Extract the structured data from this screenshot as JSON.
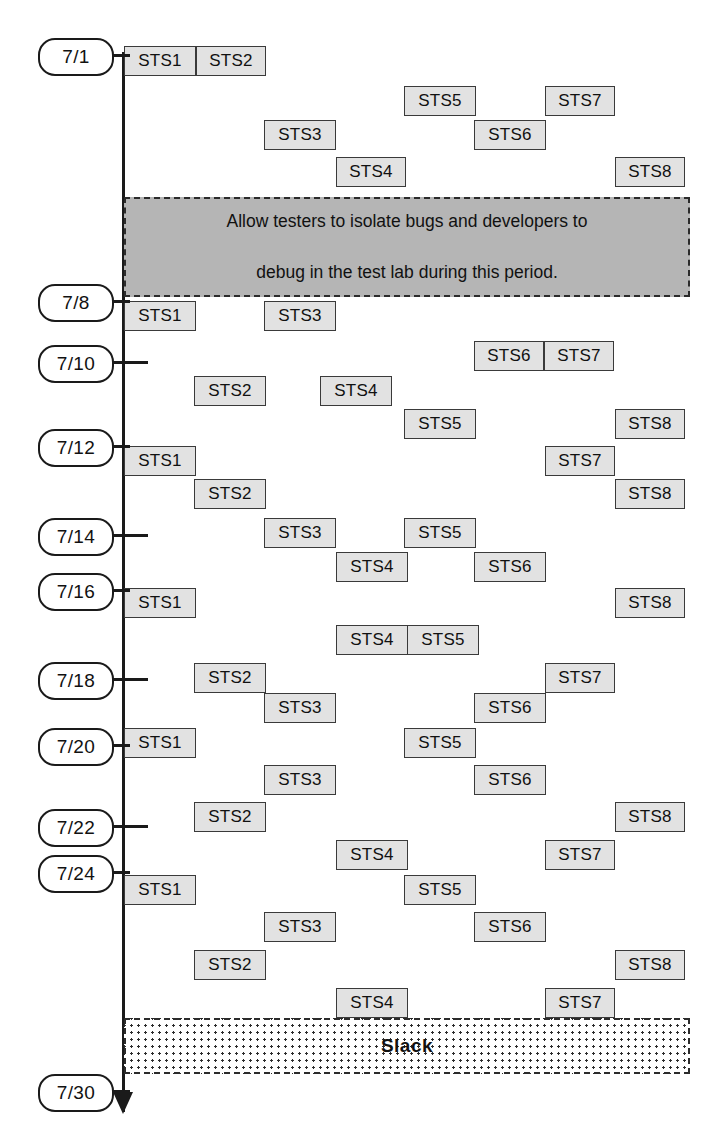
{
  "diagram": {
    "axis": {
      "orientation": "vertical-downward",
      "color": "#1a1a1a"
    },
    "box_fill": "#e2e2e2",
    "note_fill": "#b5b5b5",
    "dates": [
      {
        "label": "7/1",
        "y": 38
      },
      {
        "label": "7/8",
        "y": 284
      },
      {
        "label": "7/10",
        "y": 345
      },
      {
        "label": "7/12",
        "y": 429
      },
      {
        "label": "7/14",
        "y": 518
      },
      {
        "label": "7/16",
        "y": 573
      },
      {
        "label": "7/18",
        "y": 662
      },
      {
        "label": "7/20",
        "y": 728
      },
      {
        "label": "7/22",
        "y": 809
      },
      {
        "label": "7/24",
        "y": 855
      },
      {
        "label": "7/30",
        "y": 1074
      }
    ],
    "ticks": [
      {
        "for": "7/1",
        "long": true
      },
      {
        "for": "7/8",
        "long": true
      },
      {
        "for": "7/10",
        "long": false
      },
      {
        "for": "7/12",
        "long": true
      },
      {
        "for": "7/14",
        "long": false
      },
      {
        "for": "7/16",
        "long": true
      },
      {
        "for": "7/18",
        "long": false
      },
      {
        "for": "7/20",
        "long": true
      },
      {
        "for": "7/22",
        "long": false
      },
      {
        "for": "7/24",
        "long": true
      },
      {
        "for": "7/30",
        "long": true
      }
    ],
    "tasks": [
      {
        "label": "STS1",
        "x": 124,
        "y": 46,
        "w": 72
      },
      {
        "label": "STS2",
        "x": 196,
        "y": 46,
        "w": 70
      },
      {
        "label": "STS5",
        "x": 404,
        "y": 86,
        "w": 72
      },
      {
        "label": "STS7",
        "x": 545,
        "y": 86,
        "w": 70
      },
      {
        "label": "STS3",
        "x": 264,
        "y": 120,
        "w": 72
      },
      {
        "label": "STS6",
        "x": 474,
        "y": 120,
        "w": 72
      },
      {
        "label": "STS4",
        "x": 336,
        "y": 157,
        "w": 70
      },
      {
        "label": "STS8",
        "x": 615,
        "y": 157,
        "w": 70
      },
      {
        "label": "STS1",
        "x": 124,
        "y": 301,
        "w": 72
      },
      {
        "label": "STS3",
        "x": 264,
        "y": 301,
        "w": 72
      },
      {
        "label": "STS6",
        "x": 474,
        "y": 341,
        "w": 70
      },
      {
        "label": "STS7",
        "x": 544,
        "y": 341,
        "w": 70
      },
      {
        "label": "STS2",
        "x": 194,
        "y": 376,
        "w": 72
      },
      {
        "label": "STS4",
        "x": 320,
        "y": 376,
        "w": 72
      },
      {
        "label": "STS5",
        "x": 404,
        "y": 409,
        "w": 72
      },
      {
        "label": "STS8",
        "x": 615,
        "y": 409,
        "w": 70
      },
      {
        "label": "STS1",
        "x": 124,
        "y": 446,
        "w": 72
      },
      {
        "label": "STS7",
        "x": 545,
        "y": 446,
        "w": 70
      },
      {
        "label": "STS2",
        "x": 194,
        "y": 479,
        "w": 72
      },
      {
        "label": "STS8",
        "x": 615,
        "y": 479,
        "w": 70
      },
      {
        "label": "STS3",
        "x": 264,
        "y": 518,
        "w": 72
      },
      {
        "label": "STS5",
        "x": 404,
        "y": 518,
        "w": 72
      },
      {
        "label": "STS4",
        "x": 336,
        "y": 552,
        "w": 72
      },
      {
        "label": "STS6",
        "x": 474,
        "y": 552,
        "w": 72
      },
      {
        "label": "STS1",
        "x": 124,
        "y": 588,
        "w": 72
      },
      {
        "label": "STS8",
        "x": 615,
        "y": 588,
        "w": 70
      },
      {
        "label": "STS4",
        "x": 336,
        "y": 625,
        "w": 72
      },
      {
        "label": "STS5",
        "x": 407,
        "y": 625,
        "w": 72
      },
      {
        "label": "STS2",
        "x": 194,
        "y": 663,
        "w": 72
      },
      {
        "label": "STS7",
        "x": 545,
        "y": 663,
        "w": 70
      },
      {
        "label": "STS3",
        "x": 264,
        "y": 693,
        "w": 72
      },
      {
        "label": "STS6",
        "x": 474,
        "y": 693,
        "w": 72
      },
      {
        "label": "STS1",
        "x": 124,
        "y": 728,
        "w": 72
      },
      {
        "label": "STS5",
        "x": 404,
        "y": 728,
        "w": 72
      },
      {
        "label": "STS3",
        "x": 264,
        "y": 765,
        "w": 72
      },
      {
        "label": "STS6",
        "x": 474,
        "y": 765,
        "w": 72
      },
      {
        "label": "STS2",
        "x": 194,
        "y": 802,
        "w": 72
      },
      {
        "label": "STS8",
        "x": 615,
        "y": 802,
        "w": 70
      },
      {
        "label": "STS4",
        "x": 336,
        "y": 840,
        "w": 72
      },
      {
        "label": "STS7",
        "x": 545,
        "y": 840,
        "w": 70
      },
      {
        "label": "STS1",
        "x": 124,
        "y": 875,
        "w": 72
      },
      {
        "label": "STS5",
        "x": 404,
        "y": 875,
        "w": 72
      },
      {
        "label": "STS3",
        "x": 264,
        "y": 912,
        "w": 72
      },
      {
        "label": "STS6",
        "x": 474,
        "y": 912,
        "w": 72
      },
      {
        "label": "STS2",
        "x": 194,
        "y": 950,
        "w": 72
      },
      {
        "label": "STS8",
        "x": 615,
        "y": 950,
        "w": 70
      },
      {
        "label": "STS4",
        "x": 336,
        "y": 988,
        "w": 72
      },
      {
        "label": "STS7",
        "x": 545,
        "y": 988,
        "w": 70
      }
    ],
    "note_band": {
      "text_line1": "Allow testers to isolate bugs and developers to",
      "text_line2": "debug in the test lab during this period.",
      "x": 124,
      "y": 197,
      "w": 566,
      "h": 100
    },
    "slack_band": {
      "label": "Slack",
      "x": 124,
      "y": 1018,
      "w": 566,
      "h": 56
    }
  }
}
